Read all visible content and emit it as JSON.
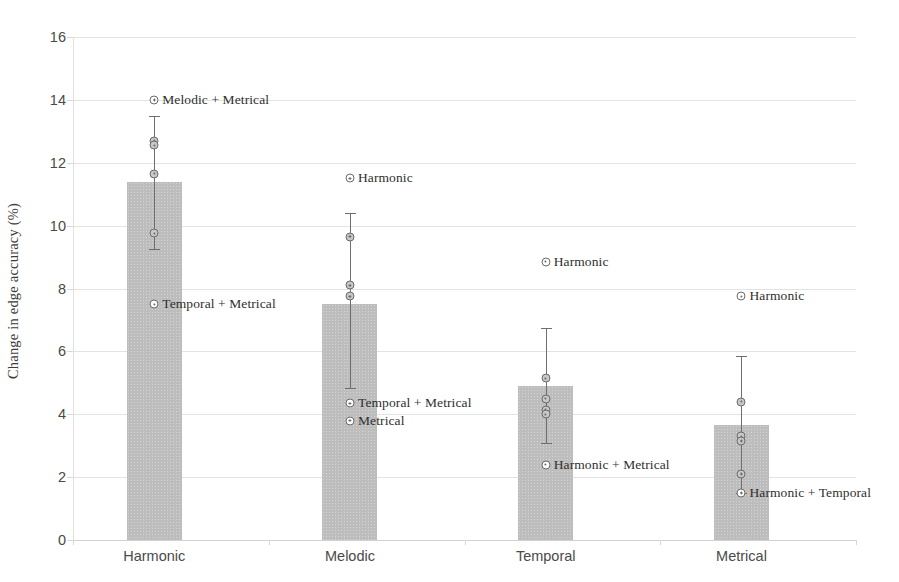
{
  "chart_data": {
    "type": "bar",
    "title": "",
    "xlabel": "",
    "ylabel": "Change in edge accuracy (%)",
    "ylim": [
      0,
      16
    ],
    "ytick_values": [
      0,
      2,
      4,
      6,
      8,
      10,
      12,
      14,
      16
    ],
    "ytick_labels": [
      "0",
      "2",
      "4",
      "6",
      "8",
      "10",
      "12",
      "14",
      "16"
    ],
    "grid": true,
    "legend": "none",
    "categories": [
      "Harmonic",
      "Melodic",
      "Temporal",
      "Metrical"
    ],
    "values": [
      11.4,
      7.5,
      4.9,
      3.65
    ],
    "error_high": [
      13.5,
      10.4,
      6.75,
      5.85
    ],
    "error_low": [
      9.25,
      4.85,
      3.1,
      1.5
    ],
    "series": [
      {
        "name": "Bar mean change in edge accuracy",
        "values": [
          11.4,
          7.5,
          4.9,
          3.65
        ]
      }
    ],
    "points": [
      {
        "category": "Harmonic",
        "value": 12.7,
        "label": ""
      },
      {
        "category": "Harmonic",
        "value": 12.55,
        "label": ""
      },
      {
        "category": "Harmonic",
        "value": 11.65,
        "label": ""
      },
      {
        "category": "Harmonic",
        "value": 9.75,
        "label": ""
      },
      {
        "category": "Melodic",
        "value": 9.65,
        "label": ""
      },
      {
        "category": "Melodic",
        "value": 8.1,
        "label": ""
      },
      {
        "category": "Melodic",
        "value": 7.75,
        "label": ""
      },
      {
        "category": "Temporal",
        "value": 5.15,
        "label": ""
      },
      {
        "category": "Temporal",
        "value": 4.5,
        "label": ""
      },
      {
        "category": "Temporal",
        "value": 4.15,
        "label": ""
      },
      {
        "category": "Temporal",
        "value": 4.0,
        "label": ""
      },
      {
        "category": "Metrical",
        "value": 4.4,
        "label": ""
      },
      {
        "category": "Metrical",
        "value": 3.3,
        "label": ""
      },
      {
        "category": "Metrical",
        "value": 3.15,
        "label": ""
      },
      {
        "category": "Metrical",
        "value": 2.1,
        "label": ""
      }
    ],
    "annotations": [
      {
        "category": "Harmonic",
        "value": 14.0,
        "text": "Melodic + Metrical"
      },
      {
        "category": "Harmonic",
        "value": 7.5,
        "text": "Temporal + Metrical"
      },
      {
        "category": "Melodic",
        "value": 11.5,
        "text": "Harmonic"
      },
      {
        "category": "Melodic",
        "value": 4.35,
        "text": "Temporal + Metrical"
      },
      {
        "category": "Melodic",
        "value": 3.8,
        "text": "Metrical"
      },
      {
        "category": "Temporal",
        "value": 8.85,
        "text": "Harmonic"
      },
      {
        "category": "Temporal",
        "value": 2.4,
        "text": "Harmonic + Metrical"
      },
      {
        "category": "Metrical",
        "value": 7.75,
        "text": "Harmonic"
      },
      {
        "category": "Metrical",
        "value": 1.5,
        "text": "Harmonic + Temporal"
      }
    ],
    "colors": {
      "bar_fill": "#bdbdbd",
      "marker_stroke": "#6b6b6b",
      "marker_fill": "#c8c8c8",
      "errorbar": "#6e6e6e",
      "gridline": "#e3e3e3",
      "text": "#4a4a4a",
      "background": "#ffffff"
    }
  }
}
